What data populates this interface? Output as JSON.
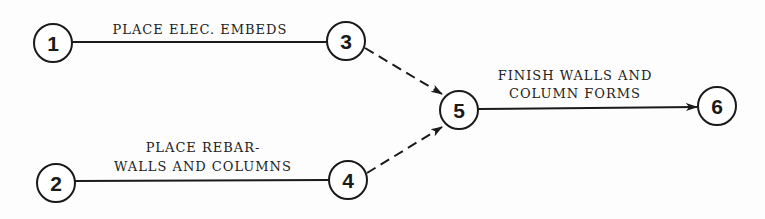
{
  "diagram": {
    "type": "activity-on-arrow network",
    "nodes": [
      {
        "id": "1",
        "label": "1",
        "x": 53,
        "y": 43
      },
      {
        "id": "2",
        "label": "2",
        "x": 56,
        "y": 183
      },
      {
        "id": "3",
        "label": "3",
        "x": 346,
        "y": 41
      },
      {
        "id": "4",
        "label": "4",
        "x": 348,
        "y": 180
      },
      {
        "id": "5",
        "label": "5",
        "x": 459,
        "y": 110
      },
      {
        "id": "6",
        "label": "6",
        "x": 717,
        "y": 106
      }
    ],
    "activities": [
      {
        "from": "1",
        "to": "3",
        "style": "solid",
        "line1": "PLACE ELEC. EMBEDS",
        "line2": ""
      },
      {
        "from": "2",
        "to": "4",
        "style": "solid",
        "line1": "PLACE REBAR-",
        "line2": "WALLS AND COLUMNS"
      },
      {
        "from": "3",
        "to": "5",
        "style": "dashed",
        "line1": "",
        "line2": ""
      },
      {
        "from": "4",
        "to": "5",
        "style": "dashed",
        "line1": "",
        "line2": ""
      },
      {
        "from": "5",
        "to": "6",
        "style": "solid-arrow",
        "line1": "FINISH WALLS AND",
        "line2": "COLUMN FORMS"
      }
    ]
  }
}
